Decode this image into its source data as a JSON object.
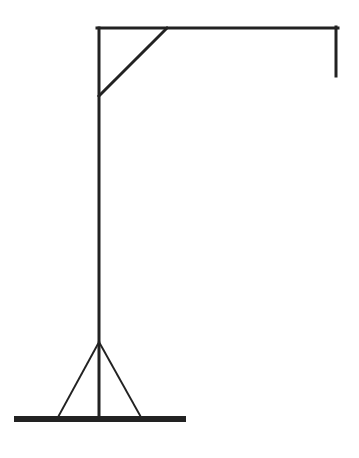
{
  "diagram": {
    "stroke_color": "#222222",
    "background": "#ffffff",
    "parts": {
      "pole": {
        "x1": 99,
        "y1": 28,
        "x2": 99,
        "y2": 419
      },
      "beam": {
        "x1": 97,
        "y1": 28,
        "x2": 338,
        "y2": 28
      },
      "rope": {
        "x1": 336,
        "y1": 27,
        "x2": 336,
        "y2": 76
      },
      "brace": {
        "x1": 167,
        "y1": 28,
        "x2": 99,
        "y2": 96
      },
      "support_left": {
        "x1": 99,
        "y1": 342,
        "x2": 57,
        "y2": 419
      },
      "support_right": {
        "x1": 99,
        "y1": 342,
        "x2": 142,
        "y2": 419
      },
      "base": {
        "x": 14,
        "y": 416,
        "width": 172,
        "height": 6
      }
    }
  }
}
